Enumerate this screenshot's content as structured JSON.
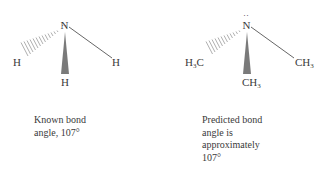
{
  "molecules": [
    {
      "name": "ammonia",
      "center_atom": "N",
      "lone_pair": "··",
      "substituents": {
        "hashed_left": "H",
        "wedge_bottom": "H",
        "line_right": "H"
      },
      "caption_lines": [
        "Known bond",
        "angle, 107°"
      ]
    },
    {
      "name": "trimethylamine",
      "center_atom": "N",
      "lone_pair": "··",
      "substituents": {
        "hashed_left": "H3C",
        "wedge_bottom": "CH3",
        "line_right": "CH3"
      },
      "caption_lines": [
        "Predicted bond",
        "angle is",
        "approximately",
        "107°"
      ]
    }
  ],
  "colors": {
    "text": "#3a3a3a",
    "bond": "#555555",
    "wedge": "#7a7a7a",
    "hash": "#9a9a9a"
  }
}
